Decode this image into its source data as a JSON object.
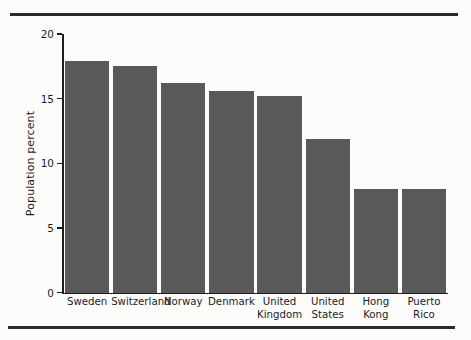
{
  "chart_data": {
    "type": "bar",
    "title": "",
    "subtitle": "",
    "xlabel": "",
    "ylabel": "Population percent",
    "ylim": [
      0,
      20
    ],
    "yticks": [
      0,
      5,
      10,
      15,
      20
    ],
    "ytick_labels": [
      "0",
      "5",
      "10",
      "15",
      "20"
    ],
    "grid": false,
    "legend": false,
    "bar_color": "#595959",
    "axis_color": "#1d1d1d",
    "background_color": "#fcfcfb",
    "categories": [
      "Sweden",
      "Switzerland",
      "Norway",
      "Denmark",
      "United Kingdom",
      "United States",
      "Hong Kong",
      "Puerto Rico"
    ],
    "category_lines": [
      [
        "Sweden"
      ],
      [
        "Switzerland"
      ],
      [
        "Norway"
      ],
      [
        "Denmark"
      ],
      [
        "United",
        "Kingdom"
      ],
      [
        "United",
        "States"
      ],
      [
        "Hong",
        "Kong"
      ],
      [
        "Puerto",
        "Rico"
      ]
    ],
    "values": [
      17.9,
      17.5,
      16.2,
      15.6,
      15.2,
      11.9,
      8.0,
      8.0
    ]
  },
  "figure": {
    "rule_top": "horizontal-rule",
    "rule_bottom": "horizontal-rule"
  }
}
